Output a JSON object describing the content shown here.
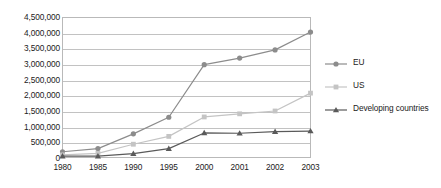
{
  "chart_data": {
    "type": "line",
    "title": "",
    "xlabel": "",
    "ylabel": "",
    "grid": true,
    "legend_position": "right",
    "categories": [
      "1980",
      "1985",
      "1990",
      "1995",
      "2000",
      "2001",
      "2002",
      "2003"
    ],
    "ylim": [
      0,
      4500000
    ],
    "ytick_step": 500000,
    "ytick_labels": [
      "4,500,000",
      "4,000,000",
      "3,500,000",
      "3,000,000",
      "2,500,000",
      "2,000,000",
      "1,500,000",
      "1,000,000",
      "500,000",
      "0"
    ],
    "ytick_values": [
      4500000,
      4000000,
      3500000,
      3000000,
      2500000,
      2000000,
      1500000,
      1000000,
      500000,
      0
    ],
    "series": [
      {
        "name": "EU",
        "marker": "circle",
        "color": "#8c8c8c",
        "values": [
          200000,
          300000,
          770000,
          1300000,
          2980000,
          3190000,
          3450000,
          4020000
        ]
      },
      {
        "name": "US",
        "marker": "square",
        "color": "#c4c4c4",
        "values": [
          100000,
          150000,
          440000,
          690000,
          1310000,
          1410000,
          1500000,
          2070000
        ]
      },
      {
        "name": "Developing countries",
        "marker": "triangle",
        "color": "#5a5a5a",
        "values": [
          60000,
          60000,
          140000,
          300000,
          800000,
          790000,
          840000,
          860000
        ]
      }
    ]
  },
  "legend": {
    "items": [
      {
        "label": "EU"
      },
      {
        "label": "US"
      },
      {
        "label": "Developing countries"
      }
    ]
  },
  "colors": {
    "eu": "#8c8c8c",
    "us": "#c4c4c4",
    "developing": "#5a5a5a",
    "grid": "#c2c2c2",
    "frame": "#b9b9b9",
    "text": "#1b1b1b"
  }
}
